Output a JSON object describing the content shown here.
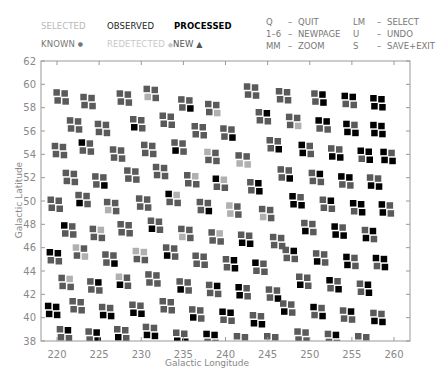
{
  "legend": {
    "selected": "SELECTED",
    "observed": "OBSERVED",
    "processed": "PROCESSED",
    "known": "KNOWN",
    "known_symbol": "●",
    "redetected": "REDETECTED",
    "redetected_symbol": "◆",
    "new": "NEW",
    "new_symbol": "▲"
  },
  "keys": [
    {
      "key": "Q",
      "dash": "–",
      "action": "QUIT",
      "key2": "LM",
      "dash2": "–",
      "action2": "SELECT"
    },
    {
      "key": "1–6",
      "dash": "–",
      "action": "NEWPAGE",
      "key2": "U",
      "dash2": "–",
      "action2": "UNDO"
    },
    {
      "key": "MM",
      "dash": "–",
      "action": "ZOOM",
      "key2": "S",
      "dash2": "–",
      "action2": "SAVE+EXIT"
    }
  ],
  "colors": {
    "observed": "#5a5a5a",
    "processed": "#000000",
    "selected": "#b0b0b0",
    "axis": "#999999"
  },
  "chart_data": {
    "type": "scatter",
    "title": "",
    "xlabel": "Galactic Longitude",
    "ylabel": "Galactic Latitude",
    "xlim": [
      218,
      262
    ],
    "ylim": [
      38,
      62
    ],
    "xticks": [
      220,
      225,
      230,
      235,
      240,
      245,
      250,
      255,
      260
    ],
    "yticks": [
      38,
      40,
      42,
      44,
      46,
      48,
      50,
      52,
      54,
      56,
      58,
      60,
      62
    ],
    "grid": false,
    "legend_position": "top",
    "marker": "2x2 square cluster per survey field",
    "status_codes": {
      "O": "observed",
      "P": "processed",
      "S": "selected"
    },
    "fields": [
      [
        220.4,
        58.9,
        "OOOO"
      ],
      [
        223.6,
        58.5,
        "OOOO"
      ],
      [
        227.9,
        58.8,
        "OOOO"
      ],
      [
        231.1,
        59.2,
        "OOSO"
      ],
      [
        235.2,
        58.3,
        "OOOP"
      ],
      [
        238.4,
        57.9,
        "OOOS"
      ],
      [
        243.0,
        59.4,
        "OOOO"
      ],
      [
        246.8,
        59.0,
        "OOOO"
      ],
      [
        251.0,
        58.8,
        "OPOP"
      ],
      [
        254.6,
        58.6,
        "PPOO"
      ],
      [
        258.0,
        58.4,
        "PPPP"
      ],
      [
        222.0,
        56.5,
        "OOOO"
      ],
      [
        225.3,
        56.2,
        "OOOO"
      ],
      [
        229.5,
        56.6,
        "OOPO"
      ],
      [
        233.0,
        56.9,
        "OOOO"
      ],
      [
        236.8,
        56.0,
        "OOOO"
      ],
      [
        240.2,
        55.8,
        "OOOP"
      ],
      [
        244.4,
        57.2,
        "OPOO"
      ],
      [
        248.0,
        56.8,
        "OOOS"
      ],
      [
        251.5,
        56.5,
        "PPOO"
      ],
      [
        254.8,
        56.2,
        "POPP"
      ],
      [
        258.0,
        56.1,
        "PPPP"
      ],
      [
        220.2,
        54.3,
        "OOOO"
      ],
      [
        223.4,
        54.6,
        "POOO"
      ],
      [
        227.1,
        54.0,
        "OOOO"
      ],
      [
        230.8,
        54.4,
        "OOOO"
      ],
      [
        234.4,
        54.6,
        "OOPO"
      ],
      [
        238.3,
        53.8,
        "SOOO"
      ],
      [
        242.0,
        53.5,
        "OOSS"
      ],
      [
        245.7,
        54.8,
        "OOOP"
      ],
      [
        249.5,
        54.4,
        "POPO"
      ],
      [
        253.0,
        54.1,
        "OOPP"
      ],
      [
        256.5,
        53.9,
        "PPOP"
      ],
      [
        259.2,
        53.8,
        "POPP"
      ],
      [
        221.5,
        52.0,
        "OOOO"
      ],
      [
        225.0,
        51.7,
        "OOOP"
      ],
      [
        228.8,
        52.2,
        "OOOO"
      ],
      [
        232.2,
        52.5,
        "OOOO"
      ],
      [
        235.9,
        51.8,
        "OSOO"
      ],
      [
        239.3,
        51.5,
        "PSOO"
      ],
      [
        243.4,
        51.2,
        "OPOP"
      ],
      [
        247.0,
        52.3,
        "OOOP"
      ],
      [
        250.7,
        52.0,
        "OPOO"
      ],
      [
        254.2,
        51.7,
        "PPOO"
      ],
      [
        257.6,
        51.6,
        "OOPP"
      ],
      [
        219.7,
        49.7,
        "OOOO"
      ],
      [
        223.0,
        50.1,
        "OOPO"
      ],
      [
        226.4,
        49.5,
        "OOSO"
      ],
      [
        230.2,
        49.8,
        "OOOO"
      ],
      [
        233.7,
        50.2,
        "PSOO"
      ],
      [
        237.4,
        49.5,
        "OOOP"
      ],
      [
        240.9,
        49.2,
        "SOSO"
      ],
      [
        244.8,
        48.9,
        "OOSO"
      ],
      [
        248.4,
        50.0,
        "POPP"
      ],
      [
        252.0,
        49.7,
        "OPOO"
      ],
      [
        255.6,
        49.4,
        "PPOP"
      ],
      [
        259.0,
        49.3,
        "POPO"
      ],
      [
        221.3,
        47.5,
        "POOO"
      ],
      [
        224.7,
        47.2,
        "OSOO"
      ],
      [
        228.0,
        47.6,
        "OOOO"
      ],
      [
        231.6,
        47.9,
        "OOPO"
      ],
      [
        235.2,
        47.2,
        "OOSO"
      ],
      [
        238.8,
        46.9,
        "OSOO"
      ],
      [
        242.3,
        46.7,
        "OOPP"
      ],
      [
        246.1,
        46.5,
        "OOOO"
      ],
      [
        249.8,
        47.7,
        "OOPO"
      ],
      [
        253.4,
        47.4,
        "POPP"
      ],
      [
        257.0,
        47.1,
        "OPPO"
      ],
      [
        219.6,
        45.2,
        "PPOO"
      ],
      [
        222.7,
        45.6,
        "SOOS"
      ],
      [
        226.2,
        45.0,
        "OOOP"
      ],
      [
        229.8,
        45.3,
        "SSOO"
      ],
      [
        233.4,
        45.6,
        "OOPO"
      ],
      [
        236.9,
        44.9,
        "OOOO"
      ],
      [
        240.5,
        44.6,
        "OPOP"
      ],
      [
        244.0,
        44.3,
        "POOO"
      ],
      [
        247.6,
        45.4,
        "OPOO"
      ],
      [
        251.2,
        45.1,
        "OOPO"
      ],
      [
        254.8,
        44.8,
        "POPO"
      ],
      [
        258.3,
        44.7,
        "PPOP"
      ],
      [
        221.0,
        43.0,
        "OSOO"
      ],
      [
        224.4,
        42.7,
        "OPOO"
      ],
      [
        227.8,
        43.1,
        "SOPO"
      ],
      [
        231.3,
        43.3,
        "OOOO"
      ],
      [
        235.0,
        42.7,
        "OOPO"
      ],
      [
        238.5,
        42.4,
        "OPOO"
      ],
      [
        242.0,
        42.2,
        "POPO"
      ],
      [
        245.6,
        42.0,
        "OOOP"
      ],
      [
        249.2,
        43.1,
        "OOPO"
      ],
      [
        252.8,
        42.8,
        "POOP"
      ],
      [
        256.4,
        42.5,
        "OPOP"
      ],
      [
        219.4,
        40.6,
        "PPPP"
      ],
      [
        222.3,
        41.0,
        "OOOO"
      ],
      [
        225.8,
        40.5,
        "OOPP"
      ],
      [
        229.4,
        40.7,
        "OOPP"
      ],
      [
        233.0,
        41.0,
        "OOOO"
      ],
      [
        236.5,
        40.3,
        "OOPO"
      ],
      [
        240.1,
        40.1,
        "PPOO"
      ],
      [
        243.7,
        39.8,
        "OOPP"
      ],
      [
        247.3,
        40.8,
        "OOPO"
      ],
      [
        250.9,
        40.5,
        "POOP"
      ],
      [
        254.4,
        40.2,
        "OPOO"
      ],
      [
        258.0,
        40.0,
        "OOPP"
      ],
      [
        220.8,
        38.6,
        "OPOO"
      ],
      [
        224.2,
        38.4,
        "OPOP"
      ],
      [
        227.6,
        38.6,
        "OOPO"
      ],
      [
        231.0,
        38.8,
        "OOPP"
      ],
      [
        234.6,
        38.3,
        "OOPP"
      ],
      [
        238.2,
        38.2,
        "PPOO"
      ],
      [
        241.8,
        38.0,
        "OOOP"
      ],
      [
        245.4,
        38.0,
        "OOPO"
      ],
      [
        249.0,
        38.4,
        "OOOO"
      ],
      [
        252.6,
        38.2,
        "OPOO"
      ],
      [
        256.2,
        38.0,
        "OOPO"
      ]
    ]
  }
}
